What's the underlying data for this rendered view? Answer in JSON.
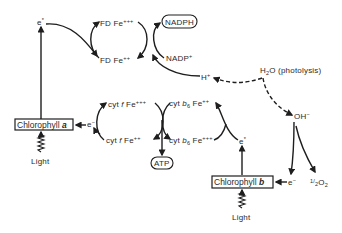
{
  "diagram": {
    "type": "photosynthesis-light-reaction-electron-flow",
    "nodes": {
      "e_star_a": {
        "base": "e",
        "sup": "*"
      },
      "fd_fe3": {
        "base": "FD Fe",
        "sup": "+++"
      },
      "fd_fe2": {
        "base": "FD Fe",
        "sup": "++"
      },
      "nadph": {
        "label": "NADPH"
      },
      "nadp": {
        "base": "NADP",
        "sup": "+"
      },
      "h_plus": {
        "base": "H",
        "sup": "+"
      },
      "h2o": {
        "base": "H",
        "sub": "2",
        "rest": "O (photolysis)"
      },
      "oh_minus": {
        "base": "OH",
        "sup": "−"
      },
      "cytf_fe3": {
        "pre": "cyt ",
        "italic": "f",
        "base": " Fe",
        "sup": "+++"
      },
      "cytf_fe2": {
        "pre": "cyt ",
        "italic": "f",
        "base": " Fe",
        "sup": "++"
      },
      "cytb6_fe2": {
        "pre": "cyt ",
        "italic": "b",
        "sub": "6",
        "base": " Fe",
        "sup": "++"
      },
      "cytb6_fe3": {
        "pre": "cyt ",
        "italic": "b",
        "sub": "6",
        "base": " Fe",
        "sup": "+++"
      },
      "atp": {
        "label": "ATP"
      },
      "e_minus_a": {
        "base": "e",
        "sup": "−"
      },
      "chlorophyll_a": {
        "base": "Chlorophyll ",
        "italic": "a"
      },
      "light_a": {
        "label": "Light"
      },
      "e_star_b": {
        "base": "e",
        "sup": "*"
      },
      "chlorophyll_b": {
        "base": "Chlorophyll ",
        "italic": "b"
      },
      "light_b": {
        "label": "Light"
      },
      "e_minus_b": {
        "base": "e",
        "sup": "−"
      },
      "half_o2": {
        "frac_num": "1",
        "frac_den": "2",
        "base": "O",
        "sub": "2"
      }
    },
    "edges": [
      {
        "from": "light_a",
        "to": "chlorophyll_a",
        "style": "squiggle"
      },
      {
        "from": "chlorophyll_a",
        "to": "e_star_a",
        "style": "solid"
      },
      {
        "from": "e_star_a",
        "to": "fd_fe2",
        "style": "solid"
      },
      {
        "from": "fd_fe2",
        "to": "fd_fe3",
        "style": "solid"
      },
      {
        "from": "fd_fe3",
        "to": "fd_fe2",
        "style": "solid"
      },
      {
        "from": "nadp",
        "to": "nadph",
        "style": "solid"
      },
      {
        "from": "h_plus",
        "to": "nadph",
        "style": "solid"
      },
      {
        "from": "h2o",
        "to": "h_plus",
        "style": "dashed"
      },
      {
        "from": "h2o",
        "to": "oh_minus",
        "style": "dashed"
      },
      {
        "from": "oh_minus",
        "to": "e_minus_b",
        "style": "solid"
      },
      {
        "from": "oh_minus",
        "to": "half_o2",
        "style": "solid"
      },
      {
        "from": "e_minus_b",
        "to": "chlorophyll_b",
        "style": "solid"
      },
      {
        "from": "light_b",
        "to": "chlorophyll_b",
        "style": "squiggle"
      },
      {
        "from": "chlorophyll_b",
        "to": "e_star_b",
        "style": "solid"
      },
      {
        "from": "e_star_b",
        "to": "cytb6_fe2",
        "style": "solid"
      },
      {
        "from": "cytb6_fe2",
        "to": "cytb6_fe3",
        "style": "solid"
      },
      {
        "from": "cytf_fe3",
        "to": "cytf_fe2",
        "style": "solid"
      },
      {
        "from": "cytf_fe2",
        "to": "atp",
        "style": "solid"
      },
      {
        "from": "cytf_fe2",
        "to": "e_minus_a",
        "style": "solid"
      },
      {
        "from": "e_minus_a",
        "to": "chlorophyll_a",
        "style": "solid"
      }
    ]
  }
}
